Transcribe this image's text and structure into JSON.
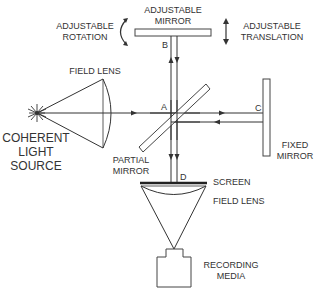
{
  "diagram": {
    "type": "Michelson interferometer schematic",
    "labels": {
      "adjustable_mirror": [
        "ADJUSTABLE",
        "MIRROR"
      ],
      "adjustable_rotation": [
        "ADJUSTABLE",
        "ROTATION"
      ],
      "adjustable_translation": [
        "ADJUSTABLE",
        "TRANSLATION"
      ],
      "field_lens_top": "FIELD LENS",
      "coherent_light_source": [
        "COHERENT",
        "LIGHT",
        "SOURCE"
      ],
      "partial_mirror": [
        "PARTIAL",
        "MIRROR"
      ],
      "fixed_mirror": [
        "FIXED",
        "MIRROR"
      ],
      "screen": "SCREEN",
      "field_lens_bottom": "FIELD LENS",
      "recording_media": [
        "RECORDING",
        "MEDIA"
      ]
    },
    "points": {
      "a": "A",
      "b": "B",
      "c": "C",
      "d": "D"
    },
    "icons": {
      "light_source": "starburst-icon",
      "rotation": "curved-double-arrow-icon",
      "translation": "vertical-double-arrow-icon",
      "camera": "camera-icon"
    },
    "colors": {
      "line": "#333333",
      "background": "#ffffff"
    }
  }
}
